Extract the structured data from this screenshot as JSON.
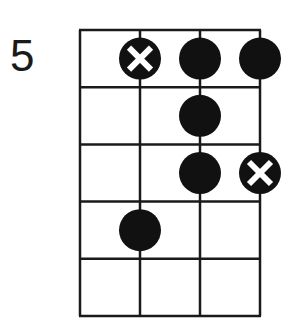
{
  "diagram": {
    "type": "fretboard-scale-diagram",
    "starting_fret_label": "5",
    "strings": 4,
    "frets_shown": 5,
    "colors": {
      "line": "#1a1a1a",
      "dot": "#111111",
      "root_marker_cross": "#ffffff",
      "background": "#ffffff"
    },
    "notes": [
      {
        "string": 2,
        "fret": 1,
        "marker": "root-x"
      },
      {
        "string": 3,
        "fret": 1,
        "marker": "dot"
      },
      {
        "string": 4,
        "fret": 1,
        "marker": "dot"
      },
      {
        "string": 3,
        "fret": 2,
        "marker": "dot"
      },
      {
        "string": 3,
        "fret": 3,
        "marker": "dot"
      },
      {
        "string": 4,
        "fret": 3,
        "marker": "root-x"
      },
      {
        "string": 2,
        "fret": 4,
        "marker": "dot"
      }
    ]
  }
}
